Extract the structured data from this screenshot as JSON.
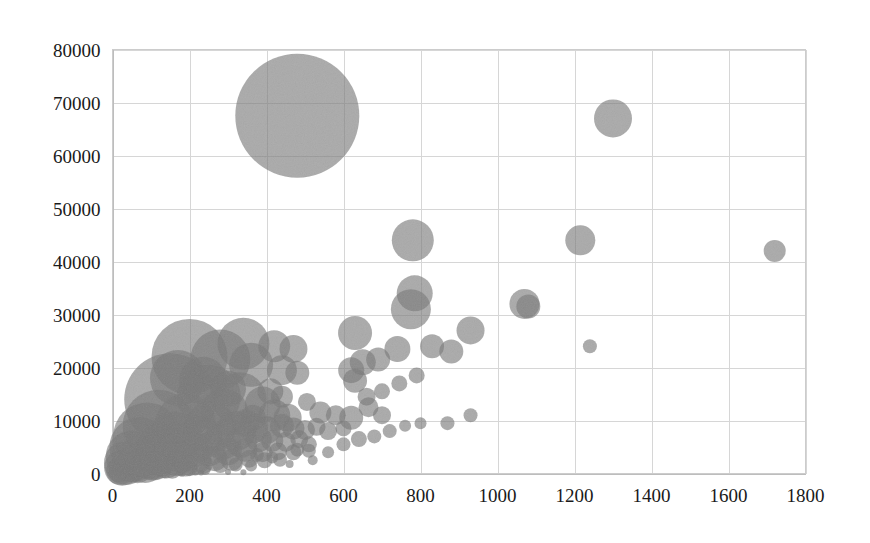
{
  "chart_data": {
    "type": "scatter",
    "subtype": "bubble",
    "title": "",
    "xlabel": "",
    "ylabel": "",
    "xlim": [
      0,
      1800
    ],
    "ylim": [
      0,
      80000
    ],
    "x_ticks": [
      0,
      200,
      400,
      600,
      800,
      1000,
      1200,
      1400,
      1600,
      1800
    ],
    "y_ticks": [
      0,
      10000,
      20000,
      30000,
      40000,
      50000,
      60000,
      70000,
      80000
    ],
    "x_tick_labels": [
      "0",
      "200",
      "400",
      "600",
      "800",
      "1000",
      "1200",
      "1400",
      "1600",
      "1800"
    ],
    "y_tick_labels": [
      "0",
      "10000",
      "20000",
      "30000",
      "40000",
      "50000",
      "60000",
      "70000",
      "80000"
    ],
    "grid": true,
    "legend": "none",
    "bubble_color": "#7a7a7a",
    "bubble_opacity": 0.62,
    "grid_color": "#d6d6d6",
    "background_color": "#ffffff",
    "points": [
      {
        "x": 480,
        "y": 67500,
        "r": 62
      },
      {
        "x": 1300,
        "y": 67000,
        "r": 19
      },
      {
        "x": 780,
        "y": 44000,
        "r": 21
      },
      {
        "x": 1215,
        "y": 44000,
        "r": 15
      },
      {
        "x": 1720,
        "y": 42000,
        "r": 11
      },
      {
        "x": 785,
        "y": 34000,
        "r": 18
      },
      {
        "x": 775,
        "y": 31000,
        "r": 20
      },
      {
        "x": 1070,
        "y": 32000,
        "r": 15
      },
      {
        "x": 1080,
        "y": 31500,
        "r": 12
      },
      {
        "x": 630,
        "y": 26500,
        "r": 17
      },
      {
        "x": 930,
        "y": 27000,
        "r": 14
      },
      {
        "x": 830,
        "y": 24000,
        "r": 12
      },
      {
        "x": 880,
        "y": 23000,
        "r": 12
      },
      {
        "x": 740,
        "y": 23500,
        "r": 13
      },
      {
        "x": 1240,
        "y": 24000,
        "r": 7
      },
      {
        "x": 340,
        "y": 24500,
        "r": 26
      },
      {
        "x": 420,
        "y": 24000,
        "r": 16
      },
      {
        "x": 470,
        "y": 23500,
        "r": 14
      },
      {
        "x": 200,
        "y": 22000,
        "r": 38
      },
      {
        "x": 280,
        "y": 21500,
        "r": 30
      },
      {
        "x": 360,
        "y": 20500,
        "r": 22
      },
      {
        "x": 440,
        "y": 19500,
        "r": 15
      },
      {
        "x": 480,
        "y": 19000,
        "r": 12
      },
      {
        "x": 620,
        "y": 19500,
        "r": 13
      },
      {
        "x": 650,
        "y": 21000,
        "r": 13
      },
      {
        "x": 690,
        "y": 21500,
        "r": 12
      },
      {
        "x": 630,
        "y": 17500,
        "r": 12
      },
      {
        "x": 150,
        "y": 14000,
        "r": 46
      },
      {
        "x": 250,
        "y": 14500,
        "r": 32
      },
      {
        "x": 330,
        "y": 14000,
        "r": 27
      },
      {
        "x": 390,
        "y": 13000,
        "r": 18
      },
      {
        "x": 290,
        "y": 11500,
        "r": 24
      },
      {
        "x": 420,
        "y": 11000,
        "r": 16
      },
      {
        "x": 455,
        "y": 10500,
        "r": 14
      },
      {
        "x": 540,
        "y": 11500,
        "r": 11
      },
      {
        "x": 580,
        "y": 11000,
        "r": 10
      },
      {
        "x": 620,
        "y": 10500,
        "r": 12
      },
      {
        "x": 665,
        "y": 12500,
        "r": 10
      },
      {
        "x": 700,
        "y": 11000,
        "r": 9
      },
      {
        "x": 870,
        "y": 9500,
        "r": 7
      },
      {
        "x": 930,
        "y": 11000,
        "r": 7
      },
      {
        "x": 120,
        "y": 9000,
        "r": 36
      },
      {
        "x": 190,
        "y": 9500,
        "r": 30
      },
      {
        "x": 255,
        "y": 8800,
        "r": 26
      },
      {
        "x": 320,
        "y": 8000,
        "r": 20
      },
      {
        "x": 365,
        "y": 8500,
        "r": 15
      },
      {
        "x": 400,
        "y": 8200,
        "r": 14
      },
      {
        "x": 440,
        "y": 9000,
        "r": 12
      },
      {
        "x": 470,
        "y": 8500,
        "r": 11
      },
      {
        "x": 500,
        "y": 8200,
        "r": 10
      },
      {
        "x": 530,
        "y": 8800,
        "r": 9
      },
      {
        "x": 560,
        "y": 8000,
        "r": 9
      },
      {
        "x": 600,
        "y": 8500,
        "r": 8
      },
      {
        "x": 90,
        "y": 7000,
        "r": 34
      },
      {
        "x": 160,
        "y": 6500,
        "r": 28
      },
      {
        "x": 225,
        "y": 6800,
        "r": 23
      },
      {
        "x": 285,
        "y": 6200,
        "r": 19
      },
      {
        "x": 335,
        "y": 6000,
        "r": 16
      },
      {
        "x": 380,
        "y": 6500,
        "r": 13
      },
      {
        "x": 415,
        "y": 6200,
        "r": 11
      },
      {
        "x": 450,
        "y": 6000,
        "r": 10
      },
      {
        "x": 485,
        "y": 6500,
        "r": 9
      },
      {
        "x": 70,
        "y": 5000,
        "r": 30
      },
      {
        "x": 130,
        "y": 4800,
        "r": 26
      },
      {
        "x": 195,
        "y": 4500,
        "r": 21
      },
      {
        "x": 250,
        "y": 4600,
        "r": 17
      },
      {
        "x": 300,
        "y": 4200,
        "r": 14
      },
      {
        "x": 345,
        "y": 4500,
        "r": 12
      },
      {
        "x": 390,
        "y": 4000,
        "r": 10
      },
      {
        "x": 430,
        "y": 4200,
        "r": 9
      },
      {
        "x": 470,
        "y": 4000,
        "r": 8
      },
      {
        "x": 510,
        "y": 4300,
        "r": 7
      },
      {
        "x": 50,
        "y": 3200,
        "r": 26
      },
      {
        "x": 105,
        "y": 3000,
        "r": 23
      },
      {
        "x": 165,
        "y": 3100,
        "r": 19
      },
      {
        "x": 215,
        "y": 2800,
        "r": 16
      },
      {
        "x": 265,
        "y": 2900,
        "r": 13
      },
      {
        "x": 310,
        "y": 2600,
        "r": 11
      },
      {
        "x": 355,
        "y": 2800,
        "r": 9
      },
      {
        "x": 395,
        "y": 2500,
        "r": 8
      },
      {
        "x": 435,
        "y": 2600,
        "r": 7
      },
      {
        "x": 35,
        "y": 2000,
        "r": 22
      },
      {
        "x": 85,
        "y": 1800,
        "r": 19
      },
      {
        "x": 140,
        "y": 1900,
        "r": 15
      },
      {
        "x": 190,
        "y": 1700,
        "r": 12
      },
      {
        "x": 235,
        "y": 1800,
        "r": 10
      },
      {
        "x": 280,
        "y": 1600,
        "r": 8
      },
      {
        "x": 320,
        "y": 1700,
        "r": 7
      },
      {
        "x": 360,
        "y": 1500,
        "r": 6
      },
      {
        "x": 25,
        "y": 1100,
        "r": 18
      },
      {
        "x": 65,
        "y": 1000,
        "r": 15
      },
      {
        "x": 110,
        "y": 1100,
        "r": 12
      },
      {
        "x": 155,
        "y": 900,
        "r": 10
      },
      {
        "x": 200,
        "y": 1000,
        "r": 8
      },
      {
        "x": 240,
        "y": 850,
        "r": 6
      },
      {
        "x": 20,
        "y": 500,
        "r": 14
      },
      {
        "x": 55,
        "y": 450,
        "r": 11
      },
      {
        "x": 95,
        "y": 500,
        "r": 9
      },
      {
        "x": 135,
        "y": 400,
        "r": 7
      },
      {
        "x": 175,
        "y": 450,
        "r": 5
      },
      {
        "x": 215,
        "y": 380,
        "r": 4
      },
      {
        "x": 15,
        "y": 200,
        "r": 10
      },
      {
        "x": 45,
        "y": 180,
        "r": 8
      },
      {
        "x": 80,
        "y": 200,
        "r": 6
      },
      {
        "x": 120,
        "y": 150,
        "r": 5
      },
      {
        "x": 300,
        "y": 300,
        "r": 3
      },
      {
        "x": 340,
        "y": 250,
        "r": 3
      },
      {
        "x": 180,
        "y": 120,
        "r": 4
      },
      {
        "x": 230,
        "y": 200,
        "r": 3
      },
      {
        "x": 560,
        "y": 4000,
        "r": 6
      },
      {
        "x": 520,
        "y": 2500,
        "r": 5
      },
      {
        "x": 460,
        "y": 1800,
        "r": 4
      },
      {
        "x": 600,
        "y": 5500,
        "r": 7
      },
      {
        "x": 640,
        "y": 6500,
        "r": 8
      },
      {
        "x": 680,
        "y": 7000,
        "r": 7
      },
      {
        "x": 720,
        "y": 8000,
        "r": 7
      },
      {
        "x": 760,
        "y": 9000,
        "r": 6
      },
      {
        "x": 800,
        "y": 9500,
        "r": 6
      },
      {
        "x": 345,
        "y": 9500,
        "r": 14
      },
      {
        "x": 365,
        "y": 10500,
        "r": 13
      },
      {
        "x": 300,
        "y": 16000,
        "r": 18
      },
      {
        "x": 235,
        "y": 17500,
        "r": 24
      },
      {
        "x": 170,
        "y": 18000,
        "r": 28
      },
      {
        "x": 410,
        "y": 15500,
        "r": 13
      },
      {
        "x": 440,
        "y": 14500,
        "r": 11
      },
      {
        "x": 505,
        "y": 13500,
        "r": 9
      },
      {
        "x": 660,
        "y": 14500,
        "r": 9
      },
      {
        "x": 700,
        "y": 15500,
        "r": 8
      },
      {
        "x": 745,
        "y": 17000,
        "r": 8
      },
      {
        "x": 790,
        "y": 18500,
        "r": 8
      },
      {
        "x": 510,
        "y": 5500,
        "r": 8
      },
      {
        "x": 480,
        "y": 4500,
        "r": 7
      },
      {
        "x": 415,
        "y": 3000,
        "r": 6
      },
      {
        "x": 375,
        "y": 3500,
        "r": 7
      }
    ]
  }
}
